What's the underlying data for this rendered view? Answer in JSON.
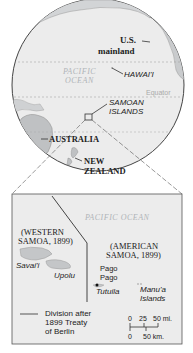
{
  "globe": {
    "labels": {
      "us_mainland_line1": "U.S.",
      "us_mainland_line2": "mainland",
      "hawaii": "HAWAI'I",
      "pacific_line1": "PACIFIC",
      "pacific_line2": "OCEAN",
      "equator": "Equator",
      "samoan_line1": "SAMOAN",
      "samoan_line2": "ISLANDS",
      "australia": "AUSTRALIA",
      "nz_line1": "NEW",
      "nz_line2": "ZEALAND"
    }
  },
  "inset": {
    "ocean_label": "PACIFIC OCEAN",
    "western_samoa_line1": "(WESTERN",
    "western_samoa_line2": "SAMOA, 1899)",
    "american_samoa_line1": "(AMERICAN",
    "american_samoa_line2": "SAMOA, 1899)",
    "savaii": "Savai'i",
    "upolu": "Upolu",
    "pago_line1": "Pago",
    "pago_line2": "Pago",
    "tutuila": "Tutuila",
    "manua_line1": "Manu'a",
    "manua_line2": "Islands",
    "legend": {
      "line1": "Division after",
      "line2": "1899 Treaty",
      "line3": "of Berlin"
    },
    "scale": {
      "miles_labels": [
        "0",
        "25",
        "50 mi."
      ],
      "km_labels": [
        "0",
        "50 km."
      ]
    }
  },
  "colors": {
    "ocean": "#ececec",
    "land": "#c4c6c8",
    "border": "#555555",
    "text": "#222222",
    "ocean_text": "#b0b4b8"
  }
}
